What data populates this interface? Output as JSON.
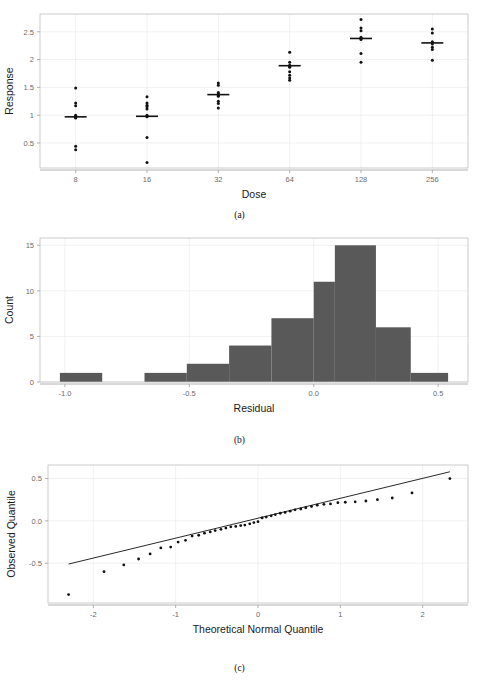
{
  "figure": {
    "panels": [
      {
        "id": "a",
        "caption": "(a)"
      },
      {
        "id": "b",
        "caption": "(b)"
      },
      {
        "id": "c",
        "caption": "(c)"
      }
    ]
  },
  "chart_data": [
    {
      "type": "scatter",
      "panel": "a",
      "caption": "(a)",
      "title": "",
      "xlabel": "Dose",
      "ylabel": "Response",
      "x_tick_labels": [
        "8",
        "16",
        "32",
        "64",
        "128",
        "256"
      ],
      "x_categories": [
        8,
        16,
        32,
        64,
        128,
        256
      ],
      "y_tick_labels": [
        "0.5",
        "1",
        "1.5",
        "2",
        "2.5"
      ],
      "y_ticks": [
        0.5,
        1,
        1.5,
        2,
        2.5
      ],
      "ylim": [
        0.05,
        2.82
      ],
      "grid": true,
      "legend": "none",
      "note": "Dot plot of response by dose with horizontal mean crossbars",
      "groups": [
        {
          "dose": 8,
          "mean": 0.97,
          "values": [
            1.49,
            1.22,
            1.17,
            1.0,
            0.98,
            0.96,
            0.95,
            0.44,
            0.38
          ]
        },
        {
          "dose": 16,
          "mean": 0.98,
          "values": [
            1.33,
            1.22,
            1.18,
            1.15,
            1.11,
            1.0,
            0.98,
            0.97,
            0.6,
            0.15
          ]
        },
        {
          "dose": 32,
          "mean": 1.37,
          "values": [
            1.58,
            1.54,
            1.41,
            1.38,
            1.36,
            1.34,
            1.25,
            1.21,
            1.13
          ]
        },
        {
          "dose": 64,
          "mean": 1.89,
          "values": [
            2.13,
            1.95,
            1.9,
            1.88,
            1.86,
            1.78,
            1.72,
            1.67,
            1.63
          ]
        },
        {
          "dose": 128,
          "mean": 2.38,
          "values": [
            2.72,
            2.57,
            2.52,
            2.4,
            2.38,
            2.36,
            2.11,
            1.95
          ]
        },
        {
          "dose": 256,
          "mean": 2.3,
          "values": [
            2.55,
            2.48,
            2.32,
            2.3,
            2.28,
            2.22,
            2.18,
            1.99
          ]
        }
      ]
    },
    {
      "type": "bar",
      "panel": "b",
      "caption": "(b)",
      "title": "",
      "xlabel": "Residual",
      "ylabel": "Count",
      "x_tick_labels": [
        "-1.0",
        "-0.5",
        "0.0",
        "0.5"
      ],
      "x_ticks": [
        -1.0,
        -0.5,
        0.0,
        0.5
      ],
      "y_tick_labels": [
        "0",
        "5",
        "10",
        "15"
      ],
      "y_ticks": [
        0,
        5,
        10,
        15
      ],
      "xlim": [
        -1.1,
        0.62
      ],
      "ylim": [
        0,
        15.8
      ],
      "grid": true,
      "legend": "none",
      "note": "Histogram of residuals, bin width 0.17",
      "bins": [
        {
          "left": -1.02,
          "right": -0.85,
          "count": 1
        },
        {
          "left": -0.85,
          "right": -0.68,
          "count": 0
        },
        {
          "left": -0.68,
          "right": -0.51,
          "count": 1
        },
        {
          "left": -0.51,
          "right": -0.34,
          "count": 2
        },
        {
          "left": -0.34,
          "right": -0.17,
          "count": 4
        },
        {
          "left": -0.17,
          "right": 0.0,
          "count": 7
        },
        {
          "left": 0.0,
          "right": 0.085,
          "count": 11
        },
        {
          "left": 0.085,
          "right": 0.25,
          "count": 15
        },
        {
          "left": 0.25,
          "right": 0.39,
          "count": 6
        },
        {
          "left": 0.39,
          "right": 0.54,
          "count": 1
        }
      ]
    },
    {
      "type": "scatter",
      "panel": "c",
      "caption": "(c)",
      "title": "",
      "xlabel": "Theoretical Normal Quantile",
      "ylabel": "Observed Quantile",
      "x_tick_labels": [
        "-2",
        "-1",
        "0",
        "1",
        "2"
      ],
      "x_ticks": [
        -2,
        -1,
        0,
        1,
        2
      ],
      "y_tick_labels": [
        "-0.5",
        "0.0",
        "0.5"
      ],
      "y_ticks": [
        -0.5,
        0.0,
        0.5
      ],
      "xlim": [
        -2.55,
        2.55
      ],
      "ylim": [
        -0.97,
        0.66
      ],
      "grid": true,
      "legend": "none",
      "note": "Normal quantile-quantile plot with reference line",
      "reference_line": {
        "x1": -2.3,
        "y1": -0.51,
        "x2": 2.33,
        "y2": 0.58
      },
      "points": [
        {
          "x": -2.3,
          "y": -0.87
        },
        {
          "x": -1.87,
          "y": -0.6
        },
        {
          "x": -1.63,
          "y": -0.52
        },
        {
          "x": -1.45,
          "y": -0.45
        },
        {
          "x": -1.31,
          "y": -0.39
        },
        {
          "x": -1.18,
          "y": -0.32
        },
        {
          "x": -1.06,
          "y": -0.31
        },
        {
          "x": -0.97,
          "y": -0.25
        },
        {
          "x": -0.88,
          "y": -0.23
        },
        {
          "x": -0.8,
          "y": -0.18
        },
        {
          "x": -0.72,
          "y": -0.17
        },
        {
          "x": -0.65,
          "y": -0.145
        },
        {
          "x": -0.58,
          "y": -0.13
        },
        {
          "x": -0.52,
          "y": -0.115
        },
        {
          "x": -0.45,
          "y": -0.1
        },
        {
          "x": -0.39,
          "y": -0.085
        },
        {
          "x": -0.33,
          "y": -0.07
        },
        {
          "x": -0.27,
          "y": -0.065
        },
        {
          "x": -0.21,
          "y": -0.055
        },
        {
          "x": -0.16,
          "y": -0.05
        },
        {
          "x": -0.1,
          "y": -0.035
        },
        {
          "x": -0.05,
          "y": -0.02
        },
        {
          "x": 0.0,
          "y": -0.01
        },
        {
          "x": 0.05,
          "y": 0.035
        },
        {
          "x": 0.1,
          "y": 0.045
        },
        {
          "x": 0.16,
          "y": 0.06
        },
        {
          "x": 0.21,
          "y": 0.075
        },
        {
          "x": 0.27,
          "y": 0.09
        },
        {
          "x": 0.33,
          "y": 0.1
        },
        {
          "x": 0.39,
          "y": 0.115
        },
        {
          "x": 0.45,
          "y": 0.13
        },
        {
          "x": 0.52,
          "y": 0.14
        },
        {
          "x": 0.58,
          "y": 0.155
        },
        {
          "x": 0.65,
          "y": 0.17
        },
        {
          "x": 0.72,
          "y": 0.185
        },
        {
          "x": 0.8,
          "y": 0.195
        },
        {
          "x": 0.88,
          "y": 0.2
        },
        {
          "x": 0.97,
          "y": 0.215
        },
        {
          "x": 1.06,
          "y": 0.22
        },
        {
          "x": 1.18,
          "y": 0.225
        },
        {
          "x": 1.31,
          "y": 0.235
        },
        {
          "x": 1.45,
          "y": 0.25
        },
        {
          "x": 1.63,
          "y": 0.27
        },
        {
          "x": 1.87,
          "y": 0.33
        },
        {
          "x": 2.33,
          "y": 0.5
        }
      ]
    }
  ]
}
